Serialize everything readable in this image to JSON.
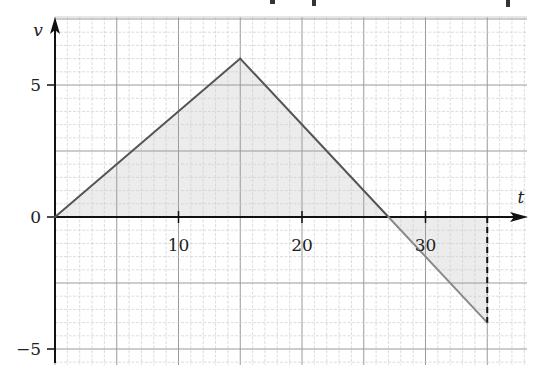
{
  "chart_data": {
    "type": "line",
    "title": "",
    "xlabel": "t",
    "ylabel": "v",
    "xlim": [
      0,
      38
    ],
    "ylim": [
      -5.5,
      7.5
    ],
    "x_ticks": [
      10,
      20,
      30
    ],
    "x_tick_labels": [
      "10",
      "20",
      "30"
    ],
    "y_ticks": [
      5,
      0,
      -5
    ],
    "y_tick_labels": [
      "5",
      "0",
      "−5"
    ],
    "grid": {
      "on": true,
      "major_x_step": 5,
      "minor_x_step": 1,
      "major_y_step": 2.5,
      "minor_y_step": 0.5
    },
    "series": [
      {
        "name": "v(t)",
        "x": [
          0,
          15,
          27,
          35
        ],
        "y": [
          0,
          6,
          0,
          -4
        ]
      }
    ],
    "annotations": [
      {
        "type": "dashed-vertical",
        "x": 35,
        "from_y": 0,
        "to_y": -4
      },
      {
        "type": "shaded-area",
        "region": "between curve and t-axis, t from 0 to 35"
      }
    ],
    "colors": {
      "line": "#555555",
      "line_below": "#8a8a8a",
      "shade": "#ececec",
      "axis": "#111111",
      "grid_major": "#9a9a9a",
      "grid_minor": "#cfcfcf"
    }
  }
}
